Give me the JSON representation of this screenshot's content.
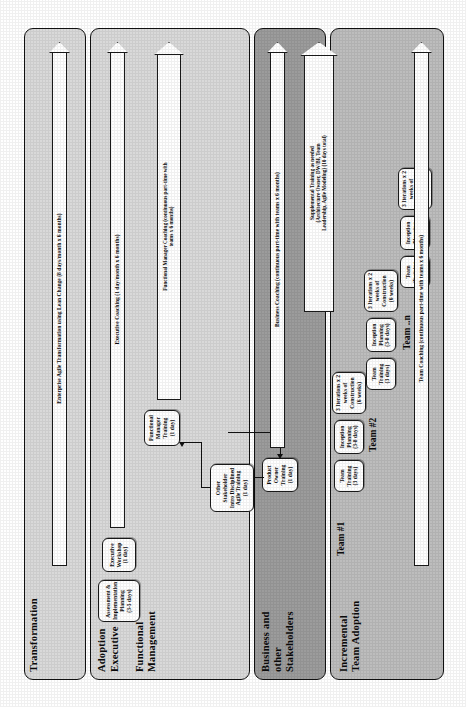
{
  "diagram": {
    "orientation": "rotated-90-ccw",
    "bands": [
      {
        "id": "transformation",
        "label": "Transformation",
        "fill": "#d9d9d9"
      },
      {
        "id": "adoption",
        "label": "Adoption",
        "sublabel": "Executive",
        "label2": "Functional\nManagement",
        "fill": "#d9d9d9"
      },
      {
        "id": "business",
        "label": "Business and\nother\nStakeholders",
        "fill": "#9c9c9c"
      },
      {
        "id": "team",
        "label": "Incremental\nTeam Adoption",
        "fill": "#bdbdbd"
      }
    ],
    "band_labels": {
      "transformation": "Transformation",
      "adoption": "Adoption",
      "executive": "Executive",
      "functional_management_l1": "Functional",
      "functional_management_l2": "Management",
      "business_l1": "Business and",
      "business_l2": "other",
      "business_l3": "Stakeholders",
      "team_l1": "Incremental",
      "team_l2": "Team Adoption"
    },
    "group_labels": {
      "team1": "Team #1",
      "team2": "Team #2",
      "teamn": "Team ..n"
    },
    "boxes": {
      "assessment": "Assessment &\nImplementation\nPlanning\n(3-5 days)",
      "exec_workshop": "Executive\nWorkshop\n(1 day)",
      "other_stakeholder": "Other Stakeholder\nIntro Disciplined\nAgile Training\n(1 day)",
      "product_owner": "Product\nOwner\nTraining\n(1 day)",
      "functional_manager": "Functional\nManager\nTraining\n(1 day)",
      "team_training": "Team\nTraining\n(3 days)",
      "inception_planning": "Inception\nPlanning\n(3-8 days)",
      "construction": "3 Iterations x 2\nweeks of\nConstruction\n(6 weeks)"
    },
    "arrows": {
      "enterprise": "Enterprise Agile Transformation using Lean Change (8 days/month x 6 months)",
      "executive_coaching": "Executive Coaching (1 day/month x 6 months)",
      "functional_manager_coaching_l1": "Functional Manager Coaching (continuous part-time with",
      "functional_manager_coaching_l2": "teams x 6 months)",
      "business_coaching": "Business Coaching (continuous part-time with teams x 6 months)",
      "supplemental_l1": "Supplemental Training as needed",
      "supplemental_l2": "(Architecture Owner, DW/BI, Team",
      "supplemental_l3": "Leadership, Agile Modeling) (10 days total)",
      "team_coaching": "Team Coaching (continuous part-time with teams x 6 months)"
    },
    "colors": {
      "band_light": "#d9d9d9",
      "band_dark": "#9c9c9c",
      "band_mid": "#bdbdbd",
      "outline": "#111111",
      "box_fill": "#ffffff"
    }
  }
}
